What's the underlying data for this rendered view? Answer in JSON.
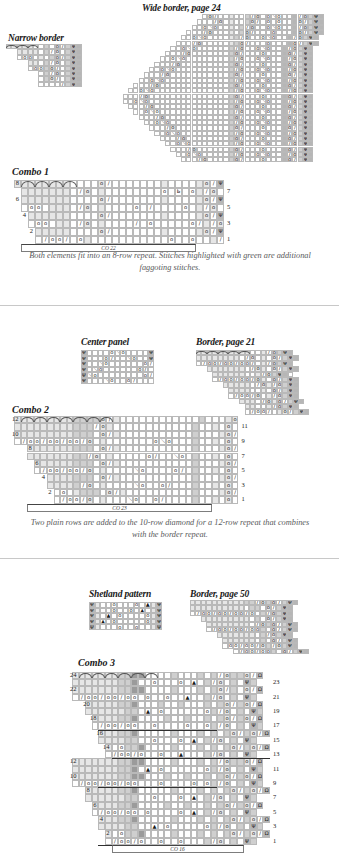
{
  "page": {
    "width": 339,
    "height": 862,
    "background": "#ffffff",
    "text_color": "#231f20",
    "caption_color": "#58595b"
  },
  "sections": [
    {
      "id": "combo-1",
      "source_charts": [
        {
          "name": "narrow-border",
          "title": "Narrow border",
          "cols": 14,
          "rows": 8
        },
        {
          "name": "wide-border",
          "title": "Wide border, page 24",
          "cols": 40,
          "rows": 28
        }
      ],
      "combo": {
        "name": "combo-1",
        "title": "Combo 1",
        "cols": 30,
        "rows": 8,
        "left_row_numbers": [
          "8",
          "6",
          "4",
          "2"
        ],
        "right_row_numbers": [
          "7",
          "5",
          "3",
          "1"
        ],
        "cast_on_label": "CO 22"
      },
      "caption": "Both elements fit into an 8-row repeat. Stitches highlighted with green are additional faggoting stitches."
    },
    {
      "id": "combo-2",
      "source_charts": [
        {
          "name": "center-panel",
          "title": "Center panel",
          "cols": 13,
          "rows": 6
        },
        {
          "name": "border-page-21",
          "title": "Border, page 21",
          "cols": 22,
          "rows": 12
        }
      ],
      "combo": {
        "name": "combo-2",
        "title": "Combo 2",
        "cols": 34,
        "rows": 12,
        "left_row_numbers": [
          "12",
          "10",
          "8",
          "6",
          "4",
          "2"
        ],
        "right_row_numbers": [
          "11",
          "9",
          "7",
          "5",
          "3",
          "1"
        ],
        "cast_on_label": "CO 23"
      },
      "caption": "Two plain rows are added to the 10-row diamond for a 12-row repeat that combines with the border repeat."
    },
    {
      "id": "combo-3",
      "source_charts": [
        {
          "name": "shetland-pattern",
          "title": "Shetland pattern",
          "cols": 13,
          "rows": 5
        },
        {
          "name": "border-page-50",
          "title": "Border, page 50",
          "cols": 22,
          "rows": 10
        }
      ],
      "combo": {
        "name": "combo-3",
        "title": "Combo 3",
        "cols": 30,
        "rows": 24,
        "left_row_numbers": [
          "24",
          "22",
          "20",
          "18",
          "16",
          "14",
          "12",
          "10",
          "8",
          "6",
          "4",
          "2"
        ],
        "right_row_numbers": [
          "23",
          "21",
          "19",
          "17",
          "15",
          "13",
          "11",
          "9",
          "7",
          "5",
          "3",
          "1"
        ],
        "cast_on_label": "CO 16"
      },
      "caption": ""
    }
  ],
  "symbols": {
    "yarn_over": "o",
    "k2tog": "∕",
    "ssk": "＼",
    "centered_decrease": "▲",
    "purl": "–",
    "knit_below": "Ψ",
    "bind_off": "Ω",
    "sl_st": "Ь"
  },
  "chart_data": {
    "type": "table",
    "notes": [
      "Each combo chart merges a lace border motif with a center panel motif.",
      "Grey shading indicates stockinette/garter ground; symbols mark yarn-overs and decreases."
    ]
  }
}
